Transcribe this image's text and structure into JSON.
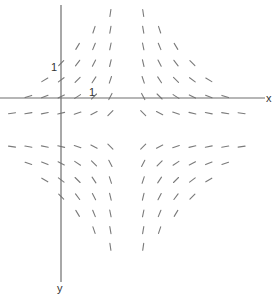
{
  "diagram": {
    "type": "slope-field",
    "axes": {
      "x_label": "x",
      "y_label": "y",
      "x_tick_label": "1",
      "y_tick_label": "1",
      "origin_px": [
        61,
        98
      ],
      "x_axis_extent_px": [
        0,
        265
      ],
      "y_axis_extent_px": [
        5,
        282
      ],
      "color": "#6e6e6e"
    },
    "field": {
      "description": "Slope marks arranged in a diamond around a singular point; slope = -(y-k)/(x-h) relative to center",
      "center_px": [
        126.5,
        130
      ],
      "grid_start_px": [
        12,
        13
      ],
      "grid_step_px": [
        16.4,
        16.7
      ],
      "cols": 15,
      "rows": 15,
      "center_index": [
        7,
        7
      ],
      "max_manhattan": 8,
      "segment_length_px": 7,
      "color": "#7a7a7a"
    }
  }
}
